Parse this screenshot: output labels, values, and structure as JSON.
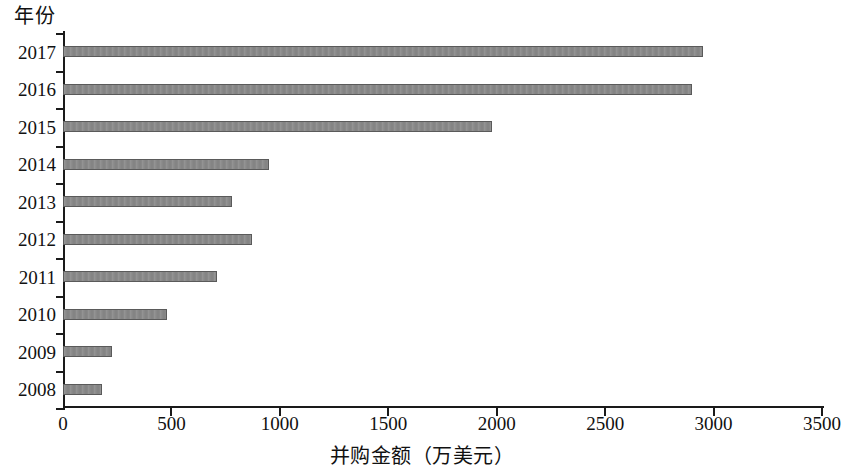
{
  "chart_data": {
    "type": "bar",
    "orientation": "horizontal",
    "title": "",
    "xlabel": "并购金额（万美元）",
    "ylabel": "年份",
    "categories": [
      "2017",
      "2016",
      "2015",
      "2014",
      "2013",
      "2012",
      "2011",
      "2010",
      "2009",
      "2008"
    ],
    "values": [
      2950,
      2900,
      1980,
      950,
      780,
      870,
      710,
      480,
      225,
      180
    ],
    "xlim": [
      0,
      3500
    ],
    "xticks": [
      0,
      500,
      1000,
      1500,
      2000,
      2500,
      3000,
      3500
    ],
    "xtick_labels": [
      "0",
      "500",
      "1000",
      "1500",
      "2000",
      "2500",
      "3000",
      "3500"
    ],
    "grid": false,
    "legend": null,
    "bar_color": "#8a8a8a",
    "bar_edge_color": "#5a5a5a",
    "axis_color": "#1a1a1a",
    "series": [
      {
        "name": "并购金额",
        "values": [
          2950,
          2900,
          1980,
          950,
          780,
          870,
          710,
          480,
          225,
          180
        ]
      }
    ]
  }
}
